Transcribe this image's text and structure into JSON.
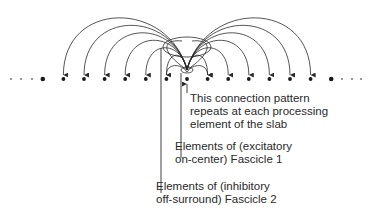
{
  "diagram": {
    "colors": {
      "ink": "#2a2a2a",
      "background": "#ffffff"
    },
    "row_y": 79,
    "center_x": 187,
    "spacing": 20.6,
    "elements_left": 7,
    "elements_right": 7,
    "labels": {
      "pattern": [
        "This connection pattern",
        "repeats at each processing",
        "element of the slab"
      ],
      "fascicle1": [
        "Elements of (excitatory",
        "on-center) Fascicle 1"
      ],
      "fascicle2": [
        "Elements of (inhibitory",
        "off-surround) Fascicle 2"
      ]
    },
    "ellipsis": "· · ·"
  }
}
